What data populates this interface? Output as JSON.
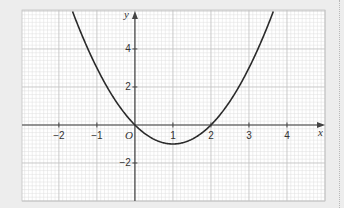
{
  "chart_data": {
    "type": "line",
    "title": "",
    "xlabel": "x",
    "ylabel": "y",
    "origin_label": "O",
    "xlim": [
      -2.97,
      5.0
    ],
    "ylim": [
      -4.0,
      6.05
    ],
    "grid": true,
    "x_ticks": [
      -2,
      -1,
      1,
      2,
      3,
      4
    ],
    "x_tick_labels": [
      "−2",
      "−1",
      "1",
      "2",
      "3",
      "4"
    ],
    "y_ticks": [
      4,
      2,
      -2
    ],
    "y_tick_labels": [
      "4",
      "2",
      "−2"
    ],
    "series": [
      {
        "name": "y = x² − 2x",
        "function": "x^2 - 2x",
        "x_range": [
          -1.8,
          3.8
        ],
        "key_points": [
          {
            "x": 0,
            "y": 0
          },
          {
            "x": 1,
            "y": -1
          },
          {
            "x": 2,
            "y": 0
          }
        ],
        "color": "#2a2a2a"
      }
    ],
    "colors": {
      "background": "#ffffff",
      "minor_grid": "#dedede",
      "major_grid": "#c4c4c4",
      "axis": "#444444",
      "curve": "#2a2a2a"
    }
  }
}
